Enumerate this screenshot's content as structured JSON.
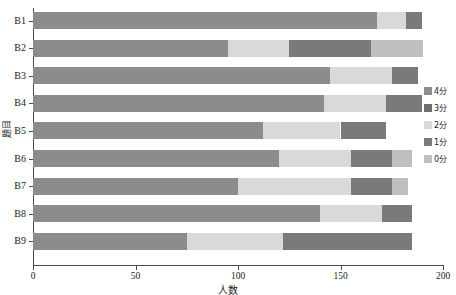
{
  "chart_data": {
    "type": "bar",
    "orientation": "horizontal",
    "stacked": true,
    "title": "",
    "xlabel": "人数",
    "ylabel": "题目",
    "xlim": [
      0,
      200
    ],
    "xticks": [
      0,
      50,
      100,
      150,
      200
    ],
    "xticklabels": [
      "0",
      "50",
      "100",
      "150",
      "200"
    ],
    "grid": false,
    "legend_position": "right",
    "categories": [
      "B1",
      "B2",
      "B3",
      "B4",
      "B5",
      "B6",
      "B7",
      "B8",
      "B9"
    ],
    "series": [
      {
        "name": "4分",
        "color": "#8c8c8c",
        "values": [
          168,
          95,
          145,
          142,
          112,
          120,
          100,
          140,
          75
        ]
      },
      {
        "name": "3分",
        "color": "#6e6e6e",
        "values": [
          0,
          0,
          0,
          0,
          0,
          0,
          0,
          0,
          0
        ]
      },
      {
        "name": "2分",
        "color": "#d9d9d9",
        "values": [
          14,
          30,
          30,
          30,
          38,
          35,
          55,
          30,
          47
        ]
      },
      {
        "name": "1分",
        "color": "#7a7a7a",
        "values": [
          8,
          40,
          13,
          18,
          22,
          20,
          20,
          15,
          63
        ]
      },
      {
        "name": "0分",
        "color": "#bfbfbf",
        "values": [
          0,
          25,
          0,
          0,
          0,
          10,
          8,
          0,
          0
        ]
      }
    ],
    "totals": [
      190,
      190,
      188,
      190,
      172,
      185,
      183,
      185,
      185
    ]
  },
  "legend": {
    "items": [
      {
        "label": "4分",
        "color": "#8c8c8c"
      },
      {
        "label": "3分",
        "color": "#6e6e6e"
      },
      {
        "label": "2分",
        "color": "#d9d9d9"
      },
      {
        "label": "1分",
        "color": "#7a7a7a"
      },
      {
        "label": "0分",
        "color": "#bfbfbf"
      }
    ]
  }
}
